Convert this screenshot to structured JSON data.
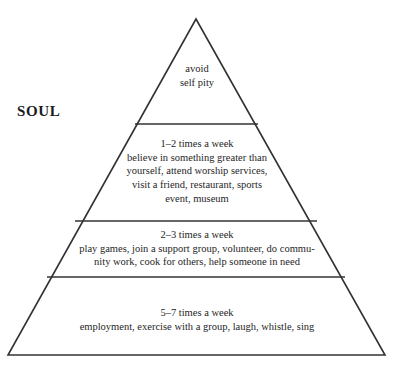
{
  "diagram": {
    "type": "pyramid",
    "side_label": "SOUL",
    "background_color": "#ffffff",
    "line_color": "#333333",
    "text_color": "#262626",
    "apex": {
      "x": 196,
      "y": 19
    },
    "base_left": {
      "x": 8,
      "y": 355
    },
    "base_right": {
      "x": 385,
      "y": 355
    },
    "dividers": [
      {
        "y": 124,
        "x_left": 135,
        "x_right": 258
      },
      {
        "y": 221,
        "x_left": 75,
        "x_right": 317
      },
      {
        "y": 277,
        "x_left": 47,
        "x_right": 345
      }
    ],
    "tiers": [
      {
        "index": 1,
        "name": "tier-avoid-self-pity",
        "frequency": "",
        "text": "avoid\nself pity"
      },
      {
        "index": 2,
        "name": "tier-1-2-times-a-week",
        "frequency": "1–2 times a week",
        "text": "1–2 times a week\nbelieve in something greater than\nyourself, attend worship services,\nvisit a friend, restaurant, sports\nevent, museum"
      },
      {
        "index": 3,
        "name": "tier-2-3-times-a-week",
        "frequency": "2–3 times a week",
        "text": "2–3 times a week\nplay games, join a support group, volunteer, do commu-\nnity work, cook for others, help someone in need"
      },
      {
        "index": 4,
        "name": "tier-5-7-times-a-week",
        "frequency": "5–7 times a week",
        "text": "5–7 times a week\nemployment, exercise with a group, laugh, whistle, sing"
      }
    ],
    "caption": ""
  }
}
